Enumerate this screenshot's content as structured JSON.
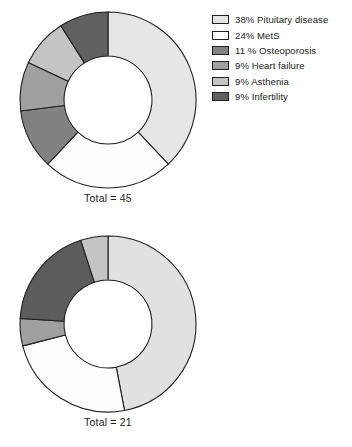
{
  "chart_data": [
    {
      "type": "pie",
      "variant": "donut",
      "title": "",
      "total_label": "Total = 45",
      "total_value": 45,
      "start_angle": 0,
      "direction": "clockwise",
      "inner_radius_ratio": 0.5,
      "stroke_color": "#231f20",
      "categories": [
        "Pituitary disease",
        "MetS",
        "Osteoporosis",
        "Heart failure",
        "Asthenia",
        "Infertility"
      ],
      "values": [
        38,
        24,
        11,
        9,
        9,
        9
      ],
      "colors": [
        "#e6e6e4",
        "#fdfdfd",
        "#828282",
        "#a0a0a0",
        "#c4c4c4",
        "#616161"
      ],
      "legend_position": "right",
      "legend": [
        {
          "label": "38% Pituitary disease",
          "color": "#e6e6e4"
        },
        {
          "label": "24% MetS",
          "color": "#fdfdfd"
        },
        {
          "label": "11 % Osteoporosis",
          "color": "#828282"
        },
        {
          "label": "9% Heart failure",
          "color": "#a0a0a0"
        },
        {
          "label": "9% Asthenia",
          "color": "#c4c4c4"
        },
        {
          "label": "9% Infertility",
          "color": "#616161"
        }
      ]
    },
    {
      "type": "pie",
      "variant": "donut",
      "title": "",
      "total_label": "Total = 21",
      "total_value": 21,
      "start_angle": 0,
      "direction": "clockwise",
      "inner_radius_ratio": 0.5,
      "stroke_color": "#231f20",
      "categories": [
        "Pituitary disease",
        "MetS",
        "Heart failure",
        "Infertility",
        "Osteoporosis"
      ],
      "values": [
        47,
        24,
        5,
        19,
        5
      ],
      "colors": [
        "#e1e1df",
        "#fdfdfd",
        "#a0a0a0",
        "#5c5c5c",
        "#c4c4c4"
      ],
      "legend_position": "right",
      "legend": [
        {
          "label": "47% Pituitary disease",
          "color": "#e1e1df"
        },
        {
          "label": "24% MetS",
          "color": "#fdfdfd"
        },
        {
          "label": "5 % Osteoporosis",
          "color": "#c4c4c4"
        },
        {
          "label": "5% Heart failure",
          "color": "#a0a0a0"
        },
        {
          "label": "19% Infertility",
          "color": "#5c5c5c"
        }
      ]
    }
  ],
  "figures": [
    {
      "name": "donut-chart-top",
      "total_label": "Total = 45"
    },
    {
      "name": "donut-chart-bottom",
      "total_label": "Total = 21"
    }
  ]
}
